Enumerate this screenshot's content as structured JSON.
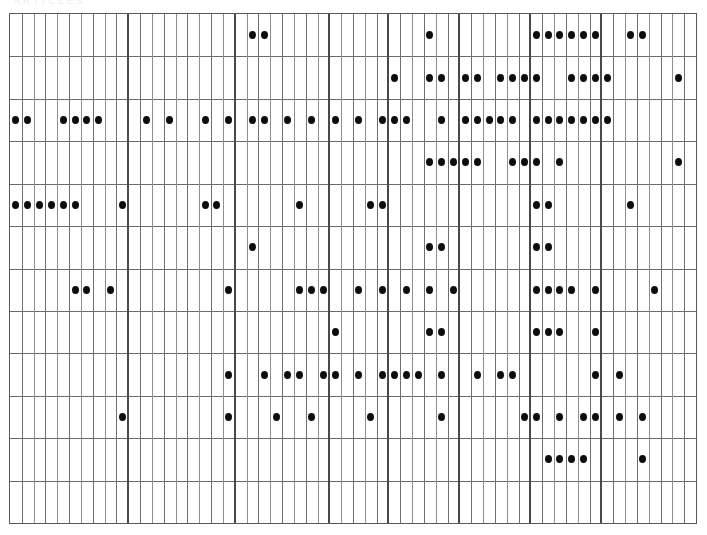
{
  "caption": {
    "text": "A R T I C L E S",
    "visible": false
  },
  "grid": {
    "title": "presence-matrix",
    "rows": 12,
    "columns": 58,
    "left": 9,
    "top": 13,
    "width": 688,
    "height": 511,
    "row_height": 42.58,
    "col_width": 11.862,
    "colors": {
      "background": "#ffffff",
      "border": "#595959",
      "row_rule": "#6b6b6b",
      "column_rule": "#8e8e8e",
      "group_rule": "#4a4a4a",
      "dot": "#0d0d0d"
    },
    "group_separator_columns": [
      10,
      19,
      27,
      32,
      38,
      44,
      50
    ],
    "row_labels": [
      "row-1",
      "row-2",
      "row-3",
      "row-4",
      "row-5",
      "row-6",
      "row-7",
      "row-8",
      "row-9",
      "row-10",
      "row-11",
      "row-12"
    ]
  },
  "chart_data": {
    "type": "heatmap",
    "title": "",
    "subtitle": "",
    "xlabel": "",
    "ylabel": "",
    "grid": true,
    "legend": null,
    "encoding": "binary presence marker (filled dot = 1, empty = 0)",
    "n_rows": 12,
    "n_columns": 58,
    "categories": [
      "c1",
      "c2",
      "c3",
      "c4",
      "c5",
      "c6",
      "c7",
      "c8",
      "c9",
      "c10",
      "c11",
      "c12",
      "c13",
      "c14",
      "c15",
      "c16",
      "c17",
      "c18",
      "c19",
      "c20",
      "c21",
      "c22",
      "c23",
      "c24",
      "c25",
      "c26",
      "c27",
      "c28",
      "c29",
      "c30",
      "c31",
      "c32",
      "c33",
      "c34",
      "c35",
      "c36",
      "c37",
      "c38",
      "c39",
      "c40",
      "c41",
      "c42",
      "c43",
      "c44",
      "c45",
      "c46",
      "c47",
      "c48",
      "c49",
      "c50",
      "c51",
      "c52",
      "c53",
      "c54",
      "c55",
      "c56",
      "c57",
      "c58"
    ],
    "series": [
      {
        "name": "row-1",
        "dots": [
          21,
          22,
          36,
          45,
          46,
          47,
          48,
          49,
          50,
          53,
          54
        ]
      },
      {
        "name": "row-2",
        "dots": [
          33,
          36,
          37,
          39,
          40,
          42,
          43,
          44,
          45,
          48,
          49,
          50,
          51,
          57
        ]
      },
      {
        "name": "row-3",
        "dots": [
          1,
          2,
          5,
          6,
          7,
          8,
          12,
          14,
          17,
          19,
          21,
          22,
          24,
          26,
          28,
          30,
          32,
          33,
          34,
          37,
          39,
          40,
          41,
          42,
          43,
          45,
          46,
          47,
          48,
          49,
          50,
          51
        ]
      },
      {
        "name": "row-4",
        "dots": [
          36,
          37,
          38,
          39,
          40,
          43,
          44,
          45,
          47,
          57
        ]
      },
      {
        "name": "row-5",
        "dots": [
          1,
          2,
          3,
          4,
          5,
          6,
          10,
          17,
          18,
          25,
          31,
          32,
          45,
          46,
          53
        ]
      },
      {
        "name": "row-6",
        "dots": [
          21,
          36,
          37,
          45,
          46
        ]
      },
      {
        "name": "row-7",
        "dots": [
          6,
          7,
          9,
          19,
          25,
          26,
          27,
          30,
          32,
          34,
          36,
          38,
          45,
          46,
          47,
          48,
          50,
          55
        ]
      },
      {
        "name": "row-8",
        "dots": [
          28,
          36,
          37,
          45,
          46,
          47,
          50
        ]
      },
      {
        "name": "row-9",
        "dots": [
          19,
          22,
          24,
          25,
          27,
          28,
          30,
          32,
          33,
          34,
          35,
          37,
          40,
          42,
          43,
          50,
          52
        ]
      },
      {
        "name": "row-10",
        "dots": [
          10,
          19,
          23,
          26,
          31,
          37,
          44,
          45,
          47,
          49,
          50,
          52,
          54
        ]
      },
      {
        "name": "row-11",
        "dots": [
          46,
          47,
          48,
          49,
          54
        ]
      },
      {
        "name": "row-12",
        "dots": []
      }
    ]
  }
}
